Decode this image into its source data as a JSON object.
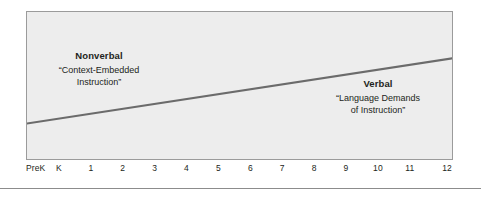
{
  "figure": {
    "background_color": "#ffffff",
    "plot_fill_color": "#ededed",
    "plot_border_color": "#9b9b9b",
    "line_color": "#6b6b6b",
    "text_color": "#231f20",
    "rule_color": "#8c8c8c"
  },
  "annotations": {
    "left": {
      "heading": "Nonverbal",
      "subtitle_line1": "“Context-Embedded",
      "subtitle_line2": "Instruction”"
    },
    "right": {
      "heading": "Verbal",
      "subtitle_line1": "“Language Demands",
      "subtitle_line2": "of Instruction”"
    }
  },
  "chart_data": {
    "type": "line",
    "title": "",
    "xlabel": "",
    "ylabel": "",
    "grid": false,
    "legend": "none",
    "categories": [
      "PreK",
      "K",
      "1",
      "2",
      "3",
      "4",
      "5",
      "6",
      "7",
      "8",
      "9",
      "10",
      "11",
      "12"
    ],
    "series": [
      {
        "name": "Language demands of instruction",
        "x": [
          "PreK",
          "12"
        ],
        "values": [
          16,
          60
        ],
        "note": "Single straight ascending line spanning the full grade range"
      }
    ],
    "ylim": [
      0,
      100
    ],
    "annotations": [
      {
        "text": "Nonverbal — “Context-Embedded Instruction”",
        "position": "upper-left"
      },
      {
        "text": "Verbal — “Language Demands of Instruction”",
        "position": "lower-right"
      }
    ]
  }
}
